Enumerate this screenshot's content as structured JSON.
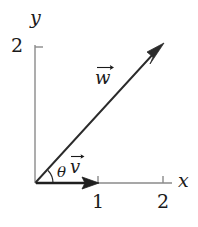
{
  "figure": {
    "kind": "vector-diagram",
    "background_color": "#ffffff",
    "ink_color": "#1a1a1a",
    "axis_color": "#7a7a7a",
    "width": 198,
    "height": 227
  },
  "axes": {
    "x_axis": {
      "label": "x",
      "label_position": {
        "x": 178,
        "y": 172
      },
      "line": {
        "x1": 35,
        "y1": 183,
        "x2": 172,
        "y2": 183
      },
      "ticks": [
        {
          "value": "1",
          "pixel_x": 98,
          "label_position": {
            "x": 92,
            "y": 193
          }
        },
        {
          "value": "2",
          "pixel_x": 163,
          "label_position": {
            "x": 157,
            "y": 193
          }
        }
      ]
    },
    "y_axis": {
      "label": "y",
      "label_position": {
        "x": 30,
        "y": 8
      },
      "line": {
        "x1": 35,
        "y1": 45,
        "x2": 35,
        "y2": 183
      },
      "ticks": [
        {
          "value": "2",
          "pixel_y": 47,
          "label_position": {
            "x": 11,
            "y": 37
          }
        }
      ]
    },
    "origin": {
      "x": 35,
      "y": 183
    }
  },
  "vectors": [
    {
      "name": "v",
      "label": "v",
      "label_position": {
        "x": 70,
        "y": 152
      },
      "start": {
        "x": 35,
        "y": 183
      },
      "end": {
        "x": 98,
        "y": 183
      },
      "components": [
        1,
        0
      ],
      "color": "#1a1a1a"
    },
    {
      "name": "w",
      "label": "w",
      "label_position": {
        "x": 95,
        "y": 63
      },
      "start": {
        "x": 35,
        "y": 183
      },
      "end": {
        "x": 163,
        "y": 44
      },
      "components": [
        2,
        2
      ],
      "color": "#1a1a1a"
    }
  ],
  "angle": {
    "symbol": "θ",
    "label_position": {
      "x": 57,
      "y": 166
    },
    "between": [
      "v",
      "w"
    ],
    "arc_radius": 18
  }
}
